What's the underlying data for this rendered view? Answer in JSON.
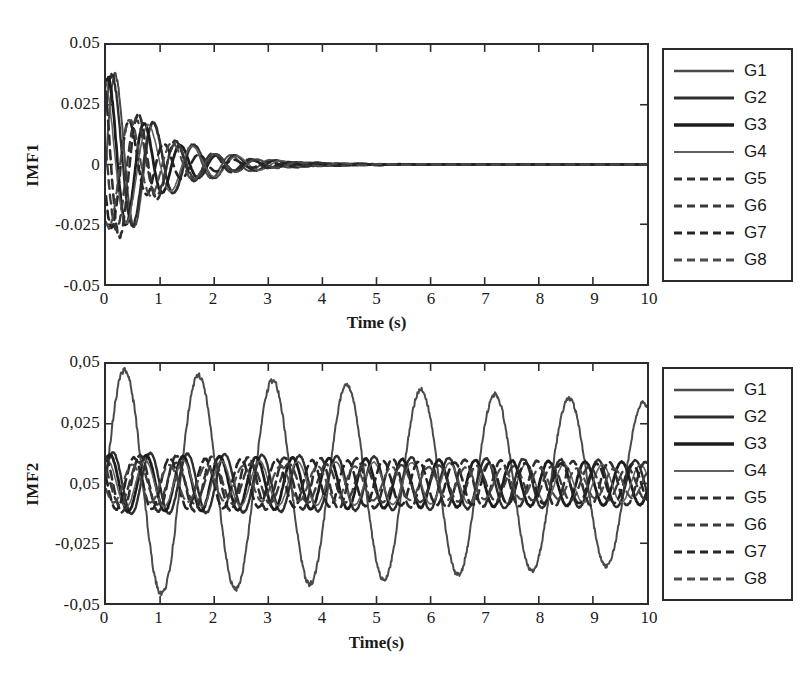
{
  "figure": {
    "background_color": "#ffffff",
    "ink_color": "#2b2b2b"
  },
  "panels": [
    {
      "name": "imf1",
      "ylabel": "IMF1",
      "xlabel": "Time (s)",
      "yticks": [
        "0.05",
        "0.025",
        "0",
        "-0.025",
        "-0.05"
      ],
      "xticks": [
        "0",
        "1",
        "2",
        "3",
        "4",
        "5",
        "6",
        "7",
        "8",
        "9",
        "10"
      ],
      "legend": [
        {
          "label": "G1",
          "style": "solid",
          "width": 2.0,
          "color": "#4a4a4a"
        },
        {
          "label": "G2",
          "style": "solid",
          "width": 2.4,
          "color": "#2e2e2e"
        },
        {
          "label": "G3",
          "style": "solid",
          "width": 2.8,
          "color": "#1c1c1c"
        },
        {
          "label": "G4",
          "style": "solid",
          "width": 1.6,
          "color": "#606060"
        },
        {
          "label": "G5",
          "style": "dashed",
          "width": 2.6,
          "color": "#2e2e2e"
        },
        {
          "label": "G6",
          "style": "dashed",
          "width": 2.4,
          "color": "#3a3a3a"
        },
        {
          "label": "G7",
          "style": "dashed",
          "width": 2.6,
          "color": "#242424"
        },
        {
          "label": "G8",
          "style": "dashed",
          "width": 2.2,
          "color": "#4a4a4a"
        }
      ]
    },
    {
      "name": "imf2",
      "ylabel": "IMF2",
      "xlabel": "Time(s)",
      "yticks": [
        "0,05",
        "0,025",
        "0,05",
        "-0,025",
        "-0,05"
      ],
      "xticks": [
        "0",
        "1",
        "2",
        "3",
        "4",
        "5",
        "6",
        "7",
        "8",
        "9",
        "10"
      ],
      "legend": [
        {
          "label": "G1",
          "style": "solid",
          "width": 2.0,
          "color": "#4a4a4a"
        },
        {
          "label": "G2",
          "style": "solid",
          "width": 2.4,
          "color": "#2e2e2e"
        },
        {
          "label": "G3",
          "style": "solid",
          "width": 2.8,
          "color": "#1c1c1c"
        },
        {
          "label": "G4",
          "style": "solid",
          "width": 1.6,
          "color": "#606060"
        },
        {
          "label": "G5",
          "style": "dashed",
          "width": 2.6,
          "color": "#2e2e2e"
        },
        {
          "label": "G6",
          "style": "dashed",
          "width": 2.4,
          "color": "#3a3a3a"
        },
        {
          "label": "G7",
          "style": "dashed",
          "width": 2.6,
          "color": "#242424"
        },
        {
          "label": "G8",
          "style": "dashed",
          "width": 2.2,
          "color": "#4a4a4a"
        }
      ]
    }
  ],
  "chart_data": [
    {
      "type": "line",
      "name": "imf1",
      "title": "",
      "xlabel": "Time (s)",
      "ylabel": "IMF1",
      "xlim": [
        0,
        10
      ],
      "ylim": [
        -0.05,
        0.05
      ],
      "xticks": [
        0,
        1,
        2,
        3,
        4,
        5,
        6,
        7,
        8,
        9,
        10
      ],
      "yticks": [
        -0.05,
        -0.025,
        0,
        0.025,
        0.05
      ],
      "ytick_labels": [
        "-0.05",
        "-0.025",
        "0",
        "0.025",
        "0.05"
      ],
      "grid": false,
      "legend_position": "right-outside",
      "description": "Eight heavily damped oscillatory signals (first intrinsic mode function). All start near +/-0.045 at t=0 and decay to approximately zero by t=4.5 s, becoming a flat line from t=5 s to t=10 s.",
      "series": [
        {
          "name": "G1",
          "style": "solid",
          "amplitude": 0.045,
          "frequency_hz": 1.4,
          "damping": 1.05,
          "phase": 0.0
        },
        {
          "name": "G2",
          "style": "solid",
          "amplitude": 0.042,
          "frequency_hz": 1.32,
          "damping": 1.0,
          "phase": 0.55
        },
        {
          "name": "G3",
          "style": "solid",
          "amplitude": 0.038,
          "frequency_hz": 1.5,
          "damping": 1.12,
          "phase": 1.1
        },
        {
          "name": "G4",
          "style": "solid",
          "amplitude": 0.035,
          "frequency_hz": 1.22,
          "damping": 0.95,
          "phase": 1.75
        },
        {
          "name": "G5",
          "style": "dashed",
          "amplitude": 0.04,
          "frequency_hz": 1.45,
          "damping": 1.08,
          "phase": 2.3
        },
        {
          "name": "G6",
          "style": "dashed",
          "amplitude": 0.033,
          "frequency_hz": 1.36,
          "damping": 1.0,
          "phase": 2.95
        },
        {
          "name": "G7",
          "style": "dashed",
          "amplitude": 0.03,
          "frequency_hz": 1.55,
          "damping": 1.15,
          "phase": 3.6
        },
        {
          "name": "G8",
          "style": "dashed",
          "amplitude": 0.028,
          "frequency_hz": 1.28,
          "damping": 0.92,
          "phase": 4.2
        }
      ]
    },
    {
      "type": "line",
      "name": "imf2",
      "title": "",
      "xlabel": "Time(s)",
      "ylabel": "IMF2",
      "xlim": [
        0,
        10
      ],
      "ylim": [
        -0.05,
        0.05
      ],
      "xticks": [
        0,
        1,
        2,
        3,
        4,
        5,
        6,
        7,
        8,
        9,
        10
      ],
      "yticks": [
        -0.05,
        -0.025,
        0,
        0.025,
        0.05
      ],
      "ytick_labels": [
        "-0,05",
        "-0,025",
        "0,05",
        "0,025",
        "0,05"
      ],
      "grid": false,
      "legend_position": "right-outside",
      "description": "Second intrinsic mode function. One dominant sustained oscillation reaches +/-0.048 at about 0.73 Hz with only slight decay across the full 10 s window; the remaining seven traces form a tight lower-amplitude bundle near +/-0.012 oscillating at roughly twice that frequency.",
      "series": [
        {
          "name": "G1",
          "style": "solid",
          "amplitude": 0.048,
          "frequency_hz": 0.73,
          "damping": 0.035,
          "phase": 0.0
        },
        {
          "name": "G2",
          "style": "solid",
          "amplitude": 0.013,
          "frequency_hz": 1.45,
          "damping": 0.03,
          "phase": 0.4
        },
        {
          "name": "G3",
          "style": "solid",
          "amplitude": 0.012,
          "frequency_hz": 1.48,
          "damping": 0.03,
          "phase": 0.9
        },
        {
          "name": "G4",
          "style": "solid",
          "amplitude": 0.01,
          "frequency_hz": 1.42,
          "damping": 0.025,
          "phase": 1.4
        },
        {
          "name": "G5",
          "style": "dashed",
          "amplitude": 0.012,
          "frequency_hz": 1.5,
          "damping": 0.03,
          "phase": 1.9
        },
        {
          "name": "G6",
          "style": "dashed",
          "amplitude": 0.009,
          "frequency_hz": 1.44,
          "damping": 0.028,
          "phase": 2.4
        },
        {
          "name": "G7",
          "style": "dashed",
          "amplitude": 0.011,
          "frequency_hz": 1.52,
          "damping": 0.032,
          "phase": 2.9
        },
        {
          "name": "G8",
          "style": "dashed",
          "amplitude": 0.008,
          "frequency_hz": 1.46,
          "damping": 0.026,
          "phase": 3.4
        }
      ]
    }
  ]
}
